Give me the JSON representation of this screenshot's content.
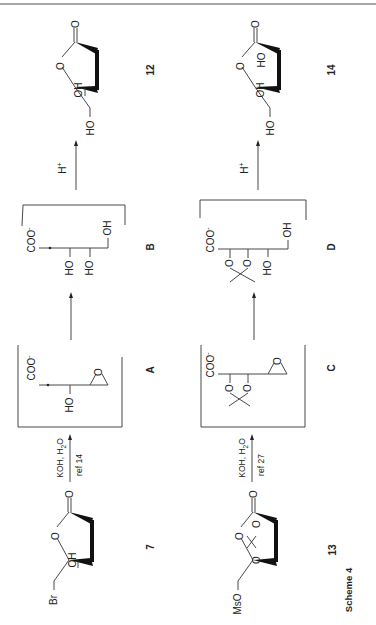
{
  "scheme": {
    "caption": "Scheme 4",
    "rows": [
      {
        "starting_material": {
          "id": "7",
          "substituent": "Br",
          "ring_groups": [
            "OH"
          ],
          "carbonyl": "O",
          "ring_oxygen": "O"
        },
        "reagent": {
          "top": "KOH, H2O",
          "top_parts": [
            "KOH, H",
            "2",
            "O"
          ],
          "bottom": "ref 14"
        },
        "intermediate_1": {
          "id": "A",
          "groups": [
            "COO-",
            "HO",
            "O"
          ],
          "coo": "COO",
          "charge": "-"
        },
        "intermediate_2": {
          "id": "B",
          "groups": [
            "COO-",
            "HO",
            "HO",
            "OH"
          ],
          "coo": "COO",
          "charge": "-"
        },
        "acid_step": {
          "label": "H+",
          "base": "H",
          "sup": "+"
        },
        "product": {
          "id": "12",
          "substituent": "HO",
          "ring_groups": [
            "OH"
          ],
          "carbonyl": "O",
          "ring_oxygen": "O"
        }
      },
      {
        "starting_material": {
          "id": "13",
          "substituent": "MsO",
          "ring_groups": [
            "O",
            "O"
          ],
          "carbonyl": "O",
          "ring_oxygen": "O"
        },
        "reagent": {
          "top": "KOH, H2O",
          "top_parts": [
            "KOH, H",
            "2",
            "O"
          ],
          "bottom": "ref 27"
        },
        "intermediate_1": {
          "id": "C",
          "groups": [
            "COO-",
            "O",
            "O",
            "O"
          ],
          "coo": "COO",
          "charge": "-"
        },
        "intermediate_2": {
          "id": "D",
          "groups": [
            "COO-",
            "O",
            "O",
            "HO",
            "OH"
          ],
          "coo": "COO",
          "charge": "-"
        },
        "acid_step": {
          "label": "H+",
          "base": "H",
          "sup": "+"
        },
        "product": {
          "id": "14",
          "substituent": "HO",
          "ring_groups": [
            "OH",
            "HO"
          ],
          "carbonyl": "O",
          "ring_oxygen": "O"
        }
      }
    ]
  },
  "atoms": {
    "O": "O",
    "OH": "OH",
    "HO": "HO",
    "Br": "Br",
    "MsO": "MsO"
  }
}
